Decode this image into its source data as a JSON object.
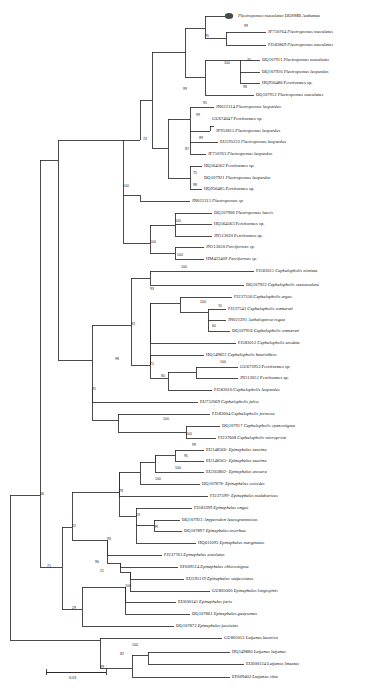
{
  "figure": {
    "type": "phylogenetic-tree",
    "scale_bar": {
      "label": "0.01",
      "x1": 46,
      "x2": 106,
      "y": 672
    },
    "highlight_marker": {
      "shape": "filled-ellipse",
      "color": "#4a4a4a",
      "taxon_index": 0
    }
  },
  "tips": [
    {
      "acc": "",
      "sci": "Plectropomus maculatus",
      "suffix": " DOSMB Andaman",
      "y": 16,
      "x": 238,
      "marked": true
    },
    {
      "acc": "JF750764 ",
      "sci": "Plectropomus maculatus",
      "suffix": "",
      "y": 32,
      "x": 268
    },
    {
      "acc": "FJ583869 ",
      "sci": "Plectropomus maculatus",
      "suffix": "",
      "y": 45,
      "x": 268
    },
    {
      "acc": "DQ107911 ",
      "sci": "Plectropomus maculatus",
      "suffix": "",
      "y": 60,
      "x": 262
    },
    {
      "acc": "DQ107920 ",
      "sci": "Plectropomus leopardus",
      "suffix": "",
      "y": 72,
      "x": 262
    },
    {
      "acc": "HQ956486 Perciformes sp.",
      "sci": "",
      "suffix": "",
      "y": 83,
      "x": 262
    },
    {
      "acc": "DQ107912 ",
      "sci": "Plectropomus maculatus",
      "suffix": "",
      "y": 95,
      "x": 256
    },
    {
      "acc": "JN021314 ",
      "sci": "Plectropomus leopardus",
      "suffix": "",
      "y": 107,
      "x": 216
    },
    {
      "acc": "GU674047 Perciformes sp.",
      "sci": "",
      "suffix": "",
      "y": 119,
      "x": 212
    },
    {
      "acc": "JF952815 ",
      "sci": "Plectropomus leopardus",
      "suffix": "",
      "y": 131,
      "x": 216
    },
    {
      "acc": "EU595233 ",
      "sci": "Plectropomus leopardus",
      "suffix": "",
      "y": 142,
      "x": 220
    },
    {
      "acc": "JF750763 ",
      "sci": "Plectropomus leopardus",
      "suffix": "",
      "y": 154,
      "x": 208
    },
    {
      "acc": "HQ564562 Perciformes sp.",
      "sci": "",
      "suffix": "",
      "y": 166,
      "x": 204
    },
    {
      "acc": "DQ107921 ",
      "sci": "Plectropomus leopardus",
      "suffix": "",
      "y": 178,
      "x": 204
    },
    {
      "acc": "HQ956485 Perciformes sp.",
      "sci": "",
      "suffix": "",
      "y": 189,
      "x": 204
    },
    {
      "acc": "JN021315 ",
      "sci": "Plectropomus sp.",
      "suffix": "",
      "y": 201,
      "x": 192
    },
    {
      "acc": "DQ107908 ",
      "sci": "Plectropomus laevis",
      "suffix": "",
      "y": 213,
      "x": 214
    },
    {
      "acc": "HQ564563 Perciformes sp.",
      "sci": "",
      "suffix": "",
      "y": 224,
      "x": 214
    },
    {
      "acc": "JN313020 Perciformes sp.",
      "sci": "",
      "suffix": "",
      "y": 236,
      "x": 214
    },
    {
      "acc": "JN313050 ",
      "sci": "Perciformes sp.",
      "suffix": "",
      "y": 247,
      "x": 206
    },
    {
      "acc": "HM422409 ",
      "sci": "Perciformes sp.",
      "suffix": "",
      "y": 259,
      "x": 206
    },
    {
      "acc": "FJ583011 ",
      "sci": "Cephalopholis miniata",
      "suffix": "",
      "y": 271,
      "x": 256
    },
    {
      "acc": "DQ107923 ",
      "sci": "Cephalopholis sexmaculata",
      "suffix": "",
      "y": 285,
      "x": 246
    },
    {
      "acc": "FJ237556 ",
      "sci": "Cephalopholis argus",
      "suffix": "",
      "y": 297,
      "x": 234
    },
    {
      "acc": "FJ237541 ",
      "sci": "Cephalopholis sonnerati",
      "suffix": "",
      "y": 309,
      "x": 228
    },
    {
      "acc": "JN021291 ",
      "sci": "Aethaloperca rogaa",
      "suffix": "",
      "y": 320,
      "x": 228
    },
    {
      "acc": "DQ107916 ",
      "sci": "Cephalopholis sonnerati",
      "suffix": "",
      "y": 331,
      "x": 232
    },
    {
      "acc": "FJ583012 ",
      "sci": "Cephalopholis urodeta",
      "suffix": "",
      "y": 343,
      "x": 238
    },
    {
      "acc": "HQ149822 ",
      "sci": "Cephalopholis hemistiktos",
      "suffix": "",
      "y": 355,
      "x": 206
    },
    {
      "acc": "GU673953 Perciformes sp.",
      "sci": "",
      "suffix": "",
      "y": 367,
      "x": 240
    },
    {
      "acc": "JN313051 Perciformes sp.",
      "sci": "",
      "suffix": "",
      "y": 378,
      "x": 240
    },
    {
      "acc": "FJ583010 ",
      "sci": "Cephalopholis leopardus",
      "suffix": "",
      "y": 390,
      "x": 214
    },
    {
      "acc": "EU752069 ",
      "sci": "Cephalopholis fulva",
      "suffix": "",
      "y": 402,
      "x": 200
    },
    {
      "acc": "FJ583004 ",
      "sci": "Cephalopholis formosa",
      "suffix": "",
      "y": 414,
      "x": 212
    },
    {
      "acc": "DQ107917 ",
      "sci": "Cephalopholis cyanostigma",
      "suffix": "",
      "y": 426,
      "x": 222
    },
    {
      "acc": "FJ237608 ",
      "sci": "Cephalopholis microprion",
      "suffix": "",
      "y": 438,
      "x": 218
    },
    {
      "acc": "EU148566- ",
      "sci": "Epinephelus tauvina",
      "suffix": "",
      "y": 450,
      "x": 206
    },
    {
      "acc": "EU148565- ",
      "sci": "Epinephelus tauvina",
      "suffix": "",
      "y": 461,
      "x": 206
    },
    {
      "acc": "EU363802- ",
      "sci": "Epinephelus awoara",
      "suffix": "",
      "y": 472,
      "x": 206
    },
    {
      "acc": "DQ107878- ",
      "sci": "Epinephelus coioides",
      "suffix": "",
      "y": 484,
      "x": 202
    },
    {
      "acc": "FJ237599- ",
      "sci": "Epinephelus malabaricus",
      "suffix": "",
      "y": 496,
      "x": 210
    },
    {
      "acc": "FJ583399 ",
      "sci": "Epinephelus ongus",
      "suffix": "",
      "y": 508,
      "x": 194
    },
    {
      "acc": "DQ107922 ",
      "sci": "Anyperodon leucogrammicus",
      "suffix": "",
      "y": 520,
      "x": 182
    },
    {
      "acc": "DQ107897 ",
      "sci": "Epinephelus morrhua",
      "suffix": "",
      "y": 531,
      "x": 184
    },
    {
      "acc": "HQ611093 ",
      "sci": "Epinephelus marginatus",
      "suffix": "",
      "y": 543,
      "x": 198
    },
    {
      "acc": "FJ237763 ",
      "sci": "Epinephelus areolatus",
      "suffix": "",
      "y": 555,
      "x": 164
    },
    {
      "acc": "EF609514 ",
      "sci": "Epinephelus chlorostigma",
      "suffix": "",
      "y": 567,
      "x": 180
    },
    {
      "acc": "EU595119 ",
      "sci": "Epinephelus sexfasciatus",
      "suffix": "",
      "y": 579,
      "x": 186
    },
    {
      "acc": "GU805000 ",
      "sci": "Epinephelus longispinis",
      "suffix": "",
      "y": 591,
      "x": 212
    },
    {
      "acc": "EU600141 ",
      "sci": "Epinephelus fario",
      "suffix": "",
      "y": 602,
      "x": 178
    },
    {
      "acc": "DQ107861 ",
      "sci": "Epinephelus guaysanus",
      "suffix": "",
      "y": 614,
      "x": 192
    },
    {
      "acc": "DQ107873 ",
      "sci": "Epinephelus fasciatus",
      "suffix": "",
      "y": 626,
      "x": 176
    },
    {
      "acc": "GU805012 ",
      "sci": "Lutjanus kasmira",
      "suffix": "",
      "y": 638,
      "x": 224
    },
    {
      "acc": "HQ149880 ",
      "sci": "Lutjanus lutjanus",
      "suffix": "",
      "y": 652,
      "x": 232
    },
    {
      "acc": "EU600134 ",
      "sci": "Lutjanus lineatus",
      "suffix": "",
      "y": 664,
      "x": 246
    },
    {
      "acc": "EF609402 ",
      "sci": "Lutjanus vitta",
      "suffix": "",
      "y": 677,
      "x": 232
    }
  ],
  "bootstraps": [
    {
      "value": "95",
      "x": 205,
      "y": 37
    },
    {
      "value": "99",
      "x": 244,
      "y": 27
    },
    {
      "value": "100",
      "x": 224,
      "y": 64
    },
    {
      "value": "70",
      "x": 247,
      "y": 61
    },
    {
      "value": "98",
      "x": 243,
      "y": 88
    },
    {
      "value": "99",
      "x": 183,
      "y": 90
    },
    {
      "value": "95",
      "x": 203,
      "y": 104
    },
    {
      "value": "99",
      "x": 196,
      "y": 116
    },
    {
      "value": "89",
      "x": 199,
      "y": 139
    },
    {
      "value": "87",
      "x": 185,
      "y": 150
    },
    {
      "value": "75",
      "x": 193,
      "y": 174
    },
    {
      "value": "98",
      "x": 193,
      "y": 186
    },
    {
      "value": "74",
      "x": 143,
      "y": 140
    },
    {
      "value": "100",
      "x": 123,
      "y": 187
    },
    {
      "value": "100",
      "x": 175,
      "y": 222
    },
    {
      "value": "100",
      "x": 150,
      "y": 243
    },
    {
      "value": "100",
      "x": 177,
      "y": 256
    },
    {
      "value": "100",
      "x": 181,
      "y": 268
    },
    {
      "value": "93",
      "x": 150,
      "y": 290
    },
    {
      "value": "100",
      "x": 200,
      "y": 303
    },
    {
      "value": "70",
      "x": 218,
      "y": 307
    },
    {
      "value": "60",
      "x": 212,
      "y": 327
    },
    {
      "value": "93",
      "x": 131,
      "y": 325
    },
    {
      "value": "71",
      "x": 150,
      "y": 365
    },
    {
      "value": "100",
      "x": 220,
      "y": 363
    },
    {
      "value": "80",
      "x": 161,
      "y": 377
    },
    {
      "value": "98",
      "x": 115,
      "y": 360
    },
    {
      "value": "100",
      "x": 163,
      "y": 420
    },
    {
      "value": "100",
      "x": 186,
      "y": 435
    },
    {
      "value": "99",
      "x": 192,
      "y": 446
    },
    {
      "value": "95",
      "x": 184,
      "y": 457
    },
    {
      "value": "100",
      "x": 175,
      "y": 469
    },
    {
      "value": "100",
      "x": 155,
      "y": 480
    },
    {
      "value": "91",
      "x": 92,
      "y": 390
    },
    {
      "value": "78",
      "x": 119,
      "y": 492
    },
    {
      "value": "59",
      "x": 136,
      "y": 516
    },
    {
      "value": "99",
      "x": 154,
      "y": 528
    },
    {
      "value": "93",
      "x": 107,
      "y": 540
    },
    {
      "value": "96",
      "x": 95,
      "y": 563
    },
    {
      "value": "21",
      "x": 100,
      "y": 572
    },
    {
      "value": "22",
      "x": 72,
      "y": 527
    },
    {
      "value": "100",
      "x": 125,
      "y": 587
    },
    {
      "value": "29",
      "x": 72,
      "y": 609
    },
    {
      "value": "71",
      "x": 47,
      "y": 567
    },
    {
      "value": "46",
      "x": 40,
      "y": 495
    },
    {
      "value": "100",
      "x": 132,
      "y": 646
    },
    {
      "value": "82",
      "x": 120,
      "y": 655
    },
    {
      "value": "99",
      "x": 100,
      "y": 668
    }
  ]
}
